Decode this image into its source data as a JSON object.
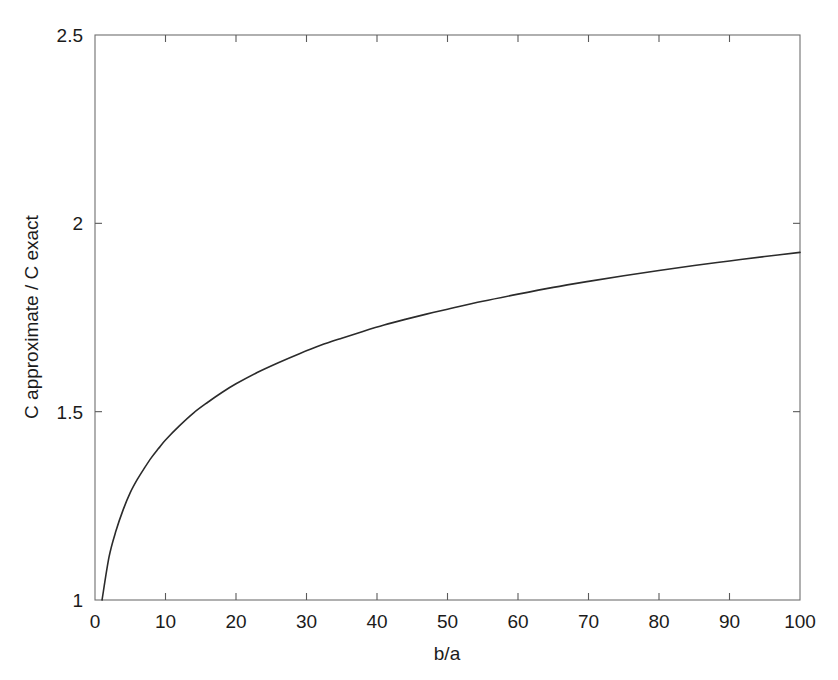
{
  "figure": {
    "background_color": "#ffffff",
    "axis_color": "#6f6f6f",
    "curve_color": "#2b2b2b",
    "text_color": "#1b1b1b"
  },
  "axes": {
    "x_title": "b/a",
    "y_title": "C approximate / C exact",
    "x_ticks": [
      "0",
      "10",
      "20",
      "30",
      "40",
      "50",
      "60",
      "70",
      "80",
      "90",
      "100"
    ],
    "y_ticks": [
      "1",
      "1.5",
      "2",
      "2.5"
    ]
  },
  "chart_data": {
    "type": "line",
    "title": "",
    "subtitle": "",
    "xlabel": "b/a",
    "ylabel": "C approximate / C exact",
    "xlim": [
      0,
      100
    ],
    "ylim": [
      1,
      2.5
    ],
    "xticks": [
      0,
      10,
      20,
      30,
      40,
      50,
      60,
      70,
      80,
      90,
      100
    ],
    "yticks": [
      1,
      1.5,
      2,
      2.5
    ],
    "grid": false,
    "legend": null,
    "legend_position": "none",
    "box": true,
    "tick_direction": "in",
    "series": [
      {
        "name": "C approximate / C exact",
        "color": "#2b2b2b",
        "line_width": 1.6,
        "marker": "none",
        "x": [
          1,
          2,
          3,
          4,
          5,
          6,
          7,
          8,
          9,
          10,
          12,
          14,
          16,
          18,
          20,
          23,
          26,
          29,
          32,
          35,
          38,
          41,
          44,
          47,
          50,
          55,
          60,
          65,
          70,
          75,
          80,
          85,
          90,
          95,
          100
        ],
        "y": [
          1.0,
          1.115,
          1.185,
          1.24,
          1.285,
          1.32,
          1.35,
          1.378,
          1.402,
          1.425,
          1.463,
          1.497,
          1.525,
          1.551,
          1.574,
          1.604,
          1.63,
          1.654,
          1.676,
          1.695,
          1.713,
          1.73,
          1.745,
          1.759,
          1.772,
          1.793,
          1.812,
          1.83,
          1.846,
          1.861,
          1.875,
          1.888,
          1.9,
          1.912,
          1.923
        ]
      }
    ],
    "annotations": []
  }
}
